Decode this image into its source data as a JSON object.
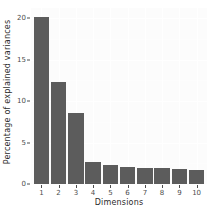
{
  "chart_data": {
    "type": "bar",
    "title": "",
    "subtitle": "",
    "xlabel": "Dimensions",
    "ylabel": "Percentage of explained variances",
    "categories": [
      "1",
      "2",
      "3",
      "4",
      "5",
      "6",
      "7",
      "8",
      "9",
      "10"
    ],
    "values": [
      20.1,
      12.3,
      8.6,
      2.6,
      2.3,
      2.0,
      1.9,
      1.9,
      1.8,
      1.7
    ],
    "series": [
      {
        "name": "Percentage of explained variances",
        "values": [
          20.1,
          12.3,
          8.6,
          2.6,
          2.3,
          2.0,
          1.9,
          1.9,
          1.8,
          1.7
        ]
      }
    ],
    "ylim": [
      0,
      21.2
    ],
    "xlim": [
      0.4,
      10.6
    ],
    "yticks": [
      0,
      5,
      10,
      15,
      20
    ],
    "ytick_labels": [
      "0",
      "5",
      "10",
      "15",
      "20"
    ],
    "xtick_labels": [
      "1",
      "2",
      "3",
      "4",
      "5",
      "6",
      "7",
      "8",
      "9",
      "10"
    ],
    "grid": true,
    "grid_color": "#ffffff",
    "legend": "none",
    "bar_color": "#5c5c5c",
    "panel_background": "#fcfcfc",
    "axis_text_color": "#4d4d4d",
    "axis_title_color": "#2b2b2b"
  }
}
